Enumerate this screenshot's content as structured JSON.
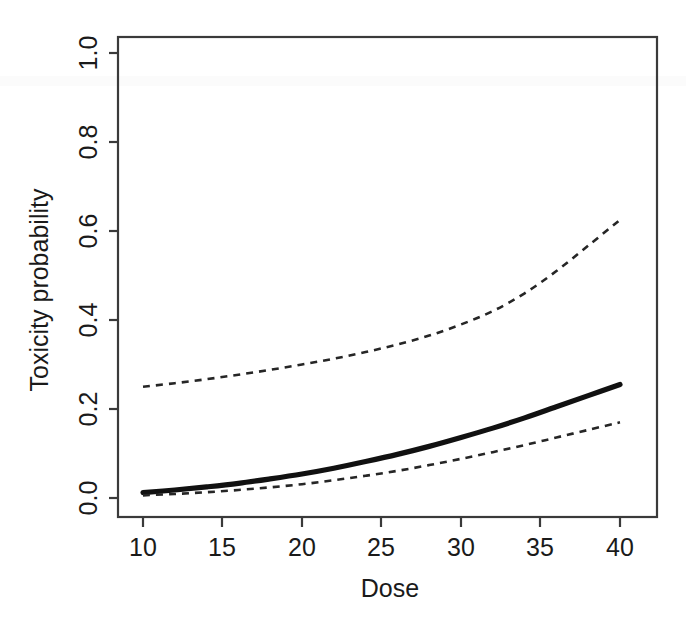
{
  "chart_data": {
    "type": "line",
    "title": "",
    "xlabel": "Dose",
    "ylabel": "Toxicity probability",
    "xlim": [
      10,
      40
    ],
    "ylim": [
      0.0,
      1.0
    ],
    "xticks": [
      10,
      15,
      20,
      25,
      30,
      35,
      40
    ],
    "xtick_labels": [
      "10",
      "15",
      "20",
      "25",
      "30",
      "35",
      "40"
    ],
    "yticks": [
      0.0,
      0.2,
      0.4,
      0.6,
      0.8,
      1.0
    ],
    "ytick_labels": [
      "0.0",
      "0.2",
      "0.4",
      "0.6",
      "0.8",
      "1.0"
    ],
    "grid": false,
    "legend": "none",
    "x": [
      10,
      12,
      14,
      16,
      18,
      20,
      22,
      24,
      26,
      28,
      30,
      32,
      34,
      36,
      38,
      40
    ],
    "series": [
      {
        "name": "Upper credible limit",
        "style": "dashed",
        "color": "#262626",
        "values": [
          0.25,
          0.258,
          0.267,
          0.277,
          0.288,
          0.3,
          0.313,
          0.328,
          0.345,
          0.365,
          0.39,
          0.42,
          0.46,
          0.51,
          0.567,
          0.625
        ]
      },
      {
        "name": "Posterior mean toxicity probability",
        "style": "solid",
        "color": "#111111",
        "values": [
          0.012,
          0.018,
          0.025,
          0.033,
          0.043,
          0.054,
          0.067,
          0.082,
          0.098,
          0.116,
          0.136,
          0.157,
          0.18,
          0.205,
          0.23,
          0.255
        ]
      },
      {
        "name": "Lower credible limit",
        "style": "dashed",
        "color": "#262626",
        "values": [
          0.006,
          0.009,
          0.013,
          0.018,
          0.024,
          0.031,
          0.04,
          0.05,
          0.061,
          0.074,
          0.088,
          0.103,
          0.119,
          0.136,
          0.153,
          0.17
        ]
      }
    ]
  },
  "axes": {
    "x_title": "Dose",
    "y_title": "Toxicity probability"
  }
}
